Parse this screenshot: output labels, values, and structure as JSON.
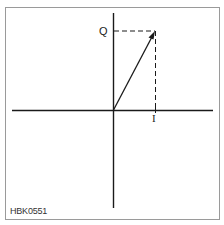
{
  "diagram": {
    "labels": {
      "q_axis": "Q",
      "i_axis": "I",
      "figure_code": "HBK0551"
    },
    "colors": {
      "line": "#1a1a1a",
      "frame": "#9a9a9a",
      "background": "#ffffff"
    },
    "vector": {
      "description": "IQ phasor vector from origin with dashed projections onto I and Q axes",
      "i_component": 1,
      "q_component": 1.9
    }
  }
}
